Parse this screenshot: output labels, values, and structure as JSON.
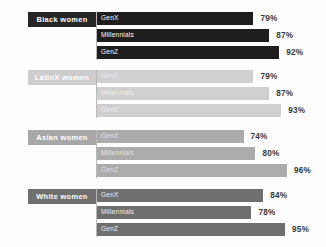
{
  "chart_data": {
    "type": "bar",
    "title": "",
    "xlabel": "",
    "ylabel": "",
    "xlim": [
      0,
      100
    ],
    "grid": false,
    "legend_position": "in-bar",
    "categories": [
      "Black women",
      "LatinX women",
      "Asian women",
      "White women"
    ],
    "series": [
      {
        "name": "GenX",
        "values": [
          79,
          87,
          74,
          84
        ]
      },
      {
        "name": "Millennials",
        "values": [
          87,
          80,
          80,
          78
        ]
      },
      {
        "name": "GenZ",
        "values": [
          92,
          93,
          96,
          95
        ]
      }
    ],
    "groups": [
      {
        "label": "Black women",
        "label_box_color": "#262626",
        "bar_color": "#1e1e1e",
        "bar_text_color": "#ffffff",
        "bars": [
          {
            "name": "GenX",
            "value": 79,
            "value_label": "79%"
          },
          {
            "name": "Millennials",
            "value": 87,
            "value_label": "87%"
          },
          {
            "name": "GenZ",
            "value": 92,
            "value_label": "92%"
          }
        ]
      },
      {
        "label": "LatinX women",
        "label_box_color": "#cdcdcd",
        "bar_color": "#cfcfcf",
        "bar_text_color": "#ededed",
        "bars": [
          {
            "name": "GenX",
            "value": 79,
            "value_label": "79%"
          },
          {
            "name": "Millennials",
            "value": 87,
            "value_label": "87%"
          },
          {
            "name": "GenZ",
            "value": 93,
            "value_label": "93%"
          }
        ]
      },
      {
        "label": "Asian women",
        "label_box_color": "#a8a8a8",
        "bar_color": "#ababab",
        "bar_text_color": "#e2e2e2",
        "bars": [
          {
            "name": "GenX",
            "value": 74,
            "value_label": "74%"
          },
          {
            "name": "Millennials",
            "value": 80,
            "value_label": "80%"
          },
          {
            "name": "GenZ",
            "value": 96,
            "value_label": "96%"
          }
        ]
      },
      {
        "label": "White women",
        "label_box_color": "#6f6f6f",
        "bar_color": "#6f6f6f",
        "bar_text_color": "#f0f0f0",
        "bars": [
          {
            "name": "GenX",
            "value": 84,
            "value_label": "84%"
          },
          {
            "name": "Millennials",
            "value": 78,
            "value_label": "78%"
          },
          {
            "name": "GenZ",
            "value": 95,
            "value_label": "95%"
          }
        ]
      }
    ]
  }
}
